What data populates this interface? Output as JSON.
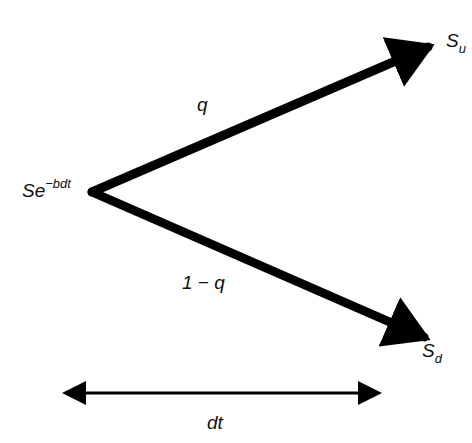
{
  "diagram": {
    "nodes": {
      "root": {
        "base": "Se",
        "exponent": "−bdt"
      },
      "up": {
        "base": "S",
        "subscript": "u"
      },
      "down": {
        "base": "S",
        "subscript": "d"
      }
    },
    "edges": {
      "up_prob": "q",
      "down_prob": "1 − q"
    },
    "time_step": "dt",
    "colors": {
      "stroke": "#000000",
      "background": "#ffffff"
    }
  }
}
